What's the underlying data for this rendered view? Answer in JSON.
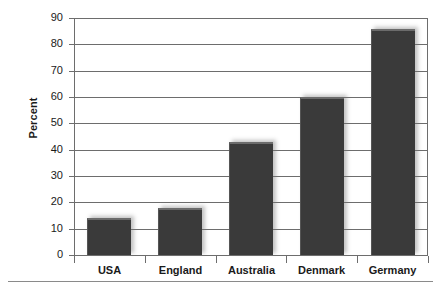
{
  "chart_data": {
    "type": "bar",
    "title": "",
    "xlabel": "",
    "ylabel": "Percent",
    "categories": [
      "USA",
      "England",
      "Australia",
      "Denmark",
      "Germany"
    ],
    "values": [
      14,
      18,
      43,
      60,
      86
    ],
    "ylim": [
      0,
      90
    ],
    "ytick_step": 10,
    "yticks": [
      0,
      10,
      20,
      30,
      40,
      50,
      60,
      70,
      80,
      90
    ],
    "ytick_labels": [
      "0",
      "10",
      "20",
      "30",
      "40",
      "50",
      "60",
      "70",
      "80",
      "90"
    ],
    "grid": true,
    "legend": false,
    "legend_position": "none",
    "bar_color": "#3a3a3a",
    "gridline_color": "#6d6d6d",
    "axis_color": "#6d6d6d",
    "text_color": "#1a1a1a",
    "background": "#ffffff"
  }
}
